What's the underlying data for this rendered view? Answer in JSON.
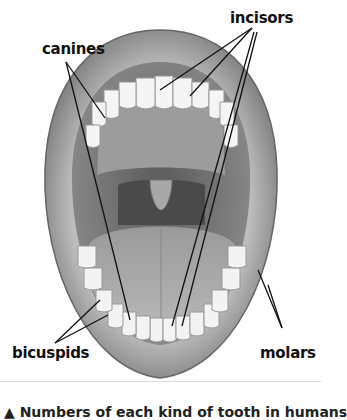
{
  "diagram": {
    "labels": {
      "incisors": "incisors",
      "canines": "canines",
      "bicuspids": "bicuspids",
      "molars": "molars"
    },
    "caption": "▲ Numbers of each kind of tooth in humans"
  }
}
